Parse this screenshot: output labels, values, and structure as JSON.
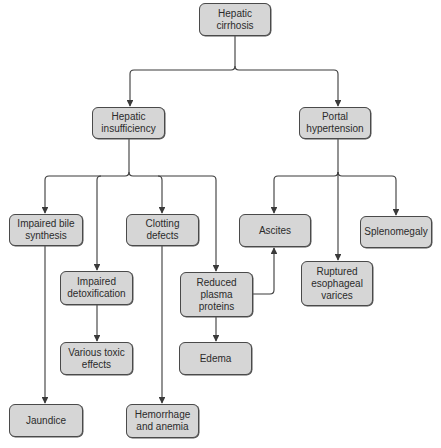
{
  "diagram": {
    "colors": {
      "node_fill": "#d6d6d6",
      "node_border": "#4a4a4a",
      "edge": "#3a3a3a",
      "text": "#2b2b2b"
    },
    "nodes": [
      {
        "id": "cirrhosis",
        "label": "Hepatic\ncirrhosis",
        "x": 199,
        "y": 3,
        "w": 72,
        "h": 33
      },
      {
        "id": "insufficiency",
        "label": "Hepatic\ninsufficiency",
        "x": 92,
        "y": 107,
        "w": 73,
        "h": 32
      },
      {
        "id": "portal",
        "label": "Portal\nhypertension",
        "x": 299,
        "y": 107,
        "w": 72,
        "h": 32
      },
      {
        "id": "bile",
        "label": "Impaired bile\nsynthesis",
        "x": 9,
        "y": 214,
        "w": 74,
        "h": 32
      },
      {
        "id": "clotting",
        "label": "Clotting\ndefects",
        "x": 126,
        "y": 214,
        "w": 73,
        "h": 32
      },
      {
        "id": "detox",
        "label": "Impaired\ndetoxification",
        "x": 60,
        "y": 271,
        "w": 73,
        "h": 34
      },
      {
        "id": "plasma",
        "label": "Reduced\nplasma\nproteins",
        "x": 180,
        "y": 272,
        "w": 73,
        "h": 45
      },
      {
        "id": "ascites",
        "label": "Ascites",
        "x": 239,
        "y": 214,
        "w": 72,
        "h": 33
      },
      {
        "id": "spleno",
        "label": "Splenomegaly",
        "x": 360,
        "y": 216,
        "w": 72,
        "h": 32
      },
      {
        "id": "varices",
        "label": "Ruptured\nesophageal\nvarices",
        "x": 301,
        "y": 261,
        "w": 72,
        "h": 45
      },
      {
        "id": "toxic",
        "label": "Various toxic\neffects",
        "x": 60,
        "y": 342,
        "w": 73,
        "h": 33
      },
      {
        "id": "edema",
        "label": "Edema",
        "x": 179,
        "y": 342,
        "w": 73,
        "h": 33
      },
      {
        "id": "jaundice",
        "label": "Jaundice",
        "x": 9,
        "y": 404,
        "w": 74,
        "h": 33
      },
      {
        "id": "hemorrhage",
        "label": "Hemorrhage\nand anemia",
        "x": 126,
        "y": 404,
        "w": 73,
        "h": 34
      }
    ],
    "edges": [
      {
        "from": "cirrhosis",
        "to": "insufficiency"
      },
      {
        "from": "cirrhosis",
        "to": "portal"
      },
      {
        "from": "insufficiency",
        "to": "bile"
      },
      {
        "from": "insufficiency",
        "to": "detox"
      },
      {
        "from": "insufficiency",
        "to": "clotting"
      },
      {
        "from": "insufficiency",
        "to": "plasma"
      },
      {
        "from": "portal",
        "to": "ascites"
      },
      {
        "from": "portal",
        "to": "varices"
      },
      {
        "from": "portal",
        "to": "spleno"
      },
      {
        "from": "bile",
        "to": "jaundice"
      },
      {
        "from": "detox",
        "to": "toxic"
      },
      {
        "from": "clotting",
        "to": "hemorrhage"
      },
      {
        "from": "plasma",
        "to": "edema"
      },
      {
        "from": "plasma",
        "to": "ascites"
      }
    ]
  }
}
